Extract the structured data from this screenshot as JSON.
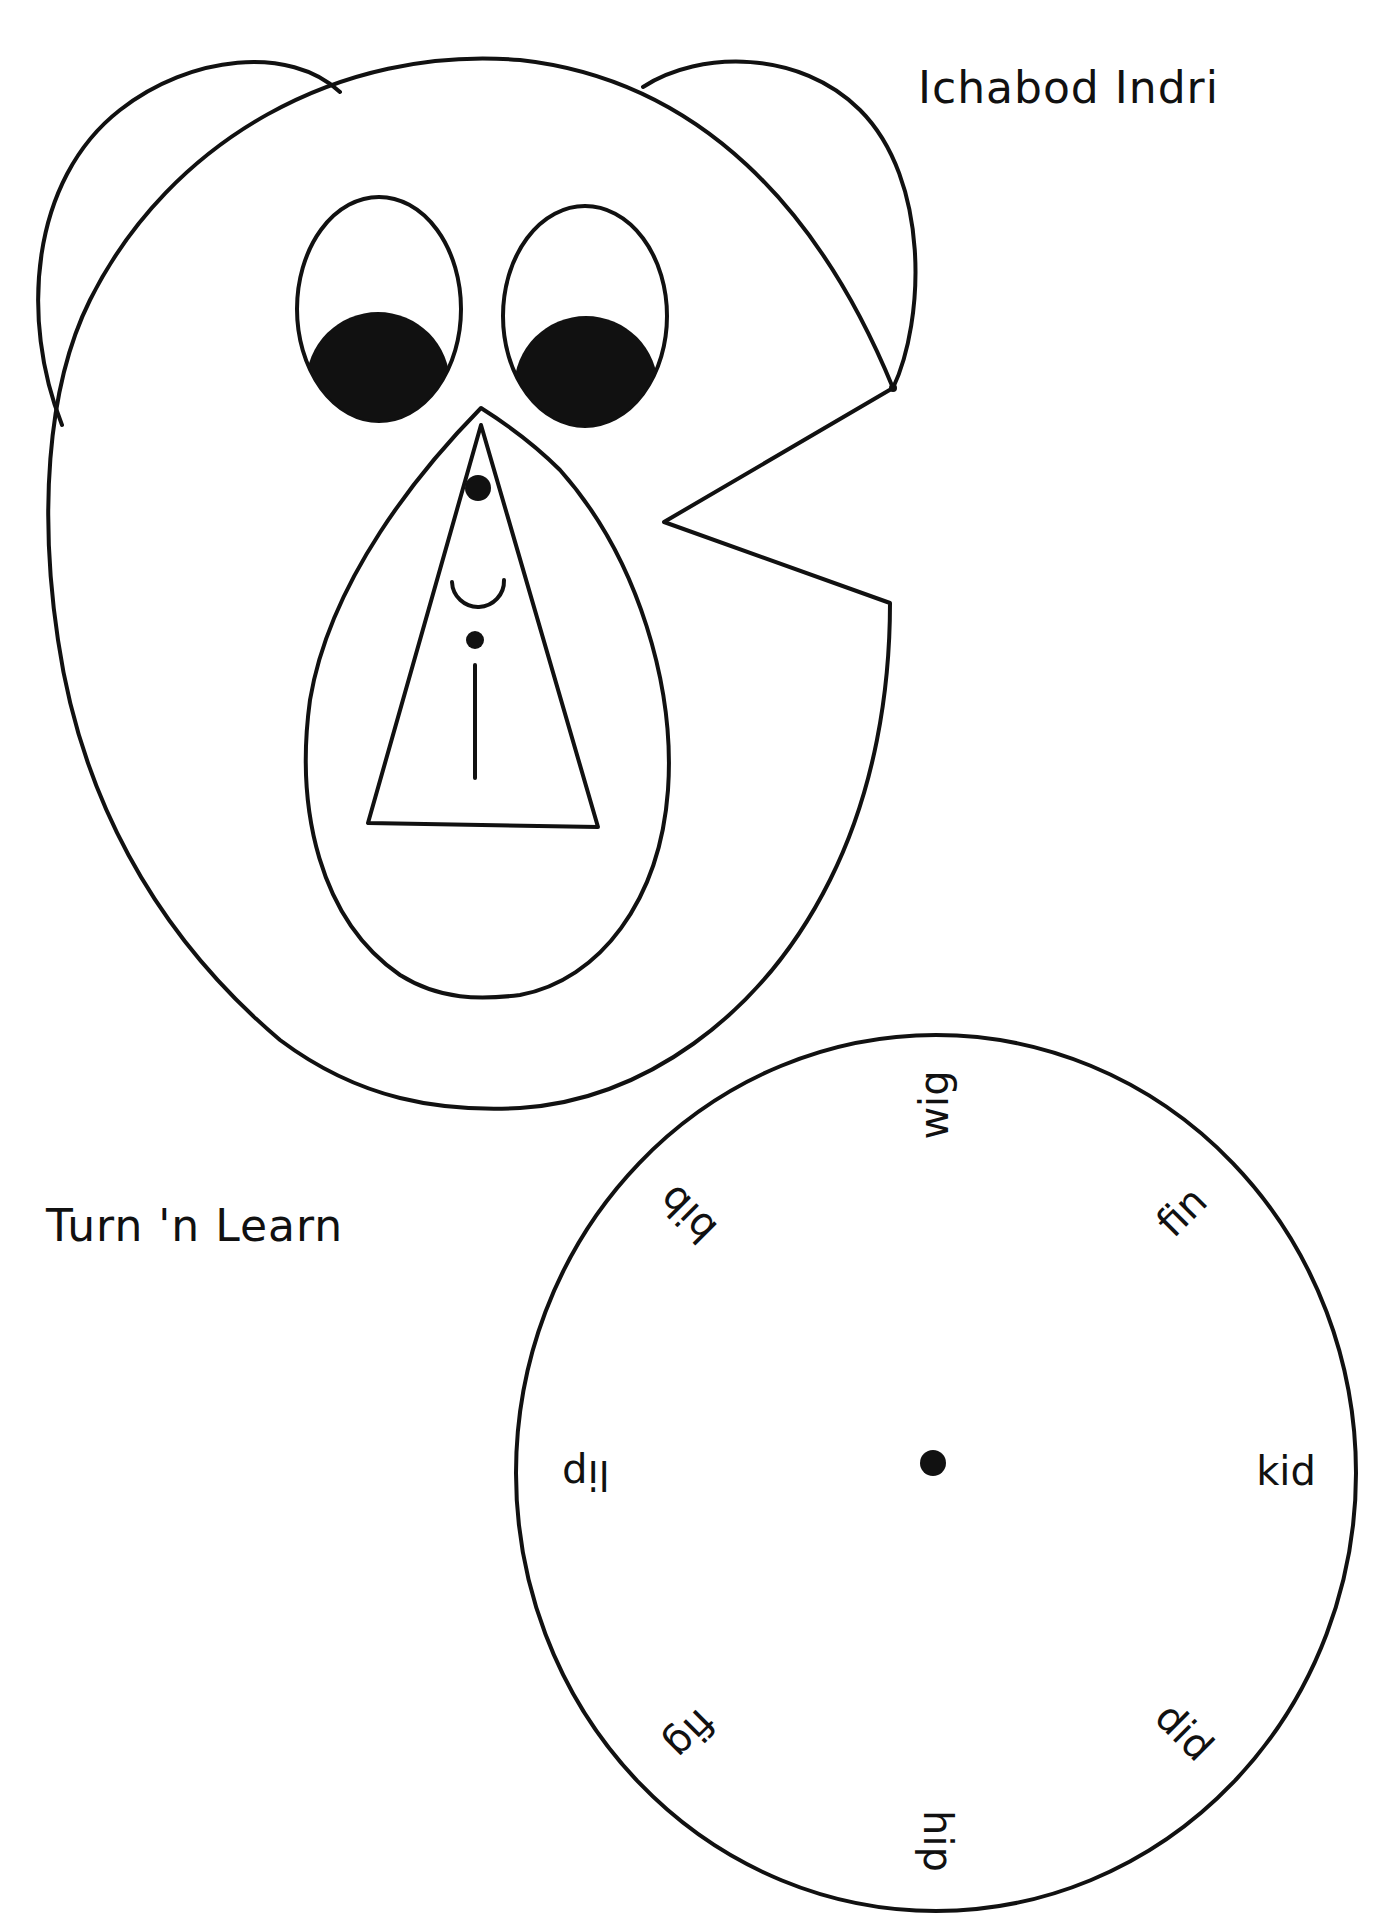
{
  "page": {
    "title": "Ichabod Indri",
    "subtitle": "Turn 'n Learn"
  },
  "colors": {
    "ink": "#111111",
    "paper": "#ffffff"
  },
  "face": {
    "parts": [
      "head",
      "left-ear",
      "right-ear",
      "left-eye",
      "right-eye",
      "left-pupil",
      "right-pupil",
      "muzzle",
      "word-triangle",
      "nose-dot",
      "smile",
      "i-dot",
      "i-stem",
      "wheel-notch"
    ]
  },
  "wheel": {
    "words": [
      {
        "text": "kid",
        "angle": 0
      },
      {
        "text": "did",
        "angle": 45
      },
      {
        "text": "hip",
        "angle": 90
      },
      {
        "text": "fig",
        "angle": 135
      },
      {
        "text": "lip",
        "angle": 180
      },
      {
        "text": "bib",
        "angle": 225
      },
      {
        "text": "wig",
        "angle": 270
      },
      {
        "text": "fin",
        "angle": 315
      }
    ]
  }
}
